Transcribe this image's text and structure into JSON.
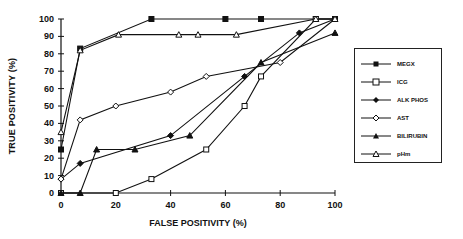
{
  "chart_data": {
    "type": "line",
    "title": "",
    "xlabel": "FALSE POSITIVITY (%)",
    "ylabel": "TRUE POSITIVITY (%)",
    "xlim": [
      0,
      100
    ],
    "ylim": [
      0,
      100
    ],
    "x_ticks": [
      0,
      20,
      40,
      60,
      80,
      100
    ],
    "y_ticks": [
      0,
      10,
      20,
      30,
      40,
      50,
      60,
      70,
      80,
      90,
      100
    ],
    "grid": false,
    "legend_position": "right",
    "series": [
      {
        "name": "MEGX",
        "marker": "filled-square",
        "x": [
          0,
          7,
          33,
          60,
          73,
          93,
          100
        ],
        "y": [
          25,
          83,
          100,
          100,
          100,
          100,
          100
        ]
      },
      {
        "name": "ICG",
        "marker": "open-square",
        "x": [
          0,
          20,
          33,
          53,
          67,
          73,
          93,
          100
        ],
        "y": [
          0,
          0,
          8,
          25,
          50,
          67,
          100,
          100
        ]
      },
      {
        "name": "ALK PHOS",
        "marker": "filled-diamond",
        "x": [
          0,
          7,
          40,
          67,
          87,
          100
        ],
        "y": [
          8,
          17,
          33,
          67,
          92,
          100
        ]
      },
      {
        "name": "AST",
        "marker": "open-diamond",
        "x": [
          0,
          7,
          20,
          40,
          53,
          80,
          100
        ],
        "y": [
          8,
          42,
          50,
          58,
          67,
          75,
          100
        ]
      },
      {
        "name": "BILIRUBIN",
        "marker": "filled-triangle",
        "x": [
          0,
          7,
          13,
          27,
          47,
          73,
          100
        ],
        "y": [
          0,
          0,
          25,
          25,
          33,
          75,
          92
        ]
      },
      {
        "name": "pHm",
        "marker": "open-triangle",
        "x": [
          0,
          7,
          21,
          43,
          50,
          64,
          93,
          100
        ],
        "y": [
          35,
          82,
          91,
          91,
          91,
          91,
          100,
          100
        ]
      }
    ]
  },
  "labels": {
    "xlabel": "FALSE POSITIVITY (%)",
    "ylabel": "TRUE POSITIVITY (%)"
  },
  "legend": {
    "items": [
      "MEGX",
      "ICG",
      "ALK PHOS",
      "AST",
      "BILIRUBIN",
      "pHm"
    ]
  }
}
